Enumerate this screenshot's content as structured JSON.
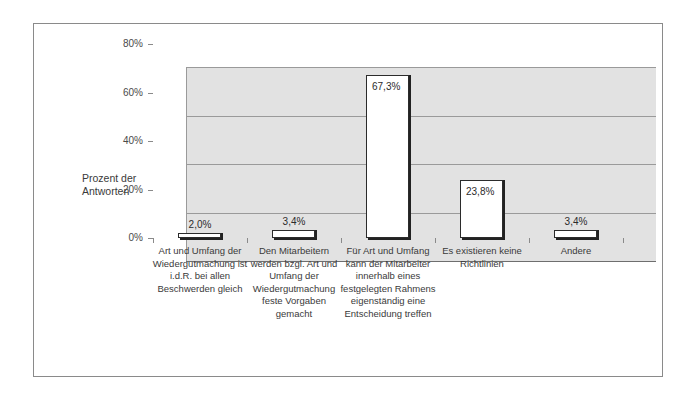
{
  "chart_data": {
    "type": "bar",
    "title": "",
    "xlabel": "",
    "ylabel": "Prozent der\nAntworten",
    "ylim": [
      0,
      80
    ],
    "yticks": [
      0,
      20,
      40,
      60,
      80
    ],
    "ytick_labels": [
      "0%",
      "20%",
      "40%",
      "60%",
      "80%"
    ],
    "grid": true,
    "legend": false,
    "value_suffix": "%",
    "categories": [
      "Art und Umfang der\nWiedergutmachung ist\ni.d.R. bei allen\nBeschwerden gleich",
      "Den Mitarbeitern\nwerden bzgl. Art und\nUmfang der\nWiedergutmachung\nfeste Vorgaben\ngemacht",
      "Für Art und Umfang\nkann der Mitarbeiter\ninnerhalb eines\nfestgelegten Rahmens\neigenständig eine\nEntscheidung treffen",
      "Es existieren keine\nRichtlinien",
      "Andere"
    ],
    "values": [
      2.0,
      3.4,
      67.3,
      23.8,
      3.4
    ],
    "value_labels": [
      "2,0%",
      "3,4%",
      "67,3%",
      "23,8%",
      "3,4%"
    ],
    "label_placement": [
      "above",
      "above",
      "inside",
      "inside",
      "above"
    ],
    "colors": {
      "bar_fill": "#ffffff",
      "bar_outline": "#2b2b2b",
      "bar_shadow": "#222222",
      "plot_background": "#e2e2e2",
      "gridline": "#9a9a9a",
      "frame": "#8a8a8a",
      "text": "#3a3a3a"
    }
  }
}
